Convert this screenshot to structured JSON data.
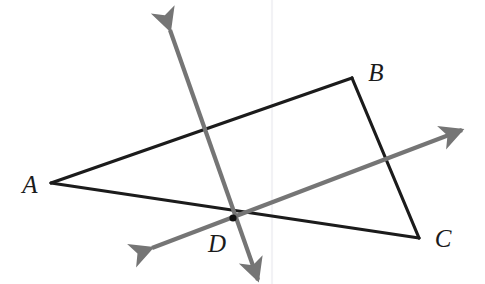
{
  "figure": {
    "width": 485,
    "height": 284,
    "background_color": "#ffffff"
  },
  "colors": {
    "triangle_stroke": "#1b1b1b",
    "ray_stroke": "#757575",
    "point_fill": "#111111",
    "guide_line": "#f2f2f5"
  },
  "labels": {
    "a": "A",
    "b": "B",
    "c": "C",
    "d": "D"
  },
  "chart_data": {
    "type": "diagram",
    "points": {
      "A": [
        51,
        183
      ],
      "B": [
        352,
        78
      ],
      "C": [
        419,
        238
      ],
      "D": [
        233,
        218
      ]
    },
    "label_positions": {
      "A": [
        30,
        184
      ],
      "B": [
        376,
        72
      ],
      "C": [
        443,
        238
      ],
      "D": [
        217,
        243
      ]
    },
    "triangle": {
      "vertices": [
        "A",
        "B",
        "C"
      ],
      "edges": [
        [
          "A",
          "B"
        ],
        [
          "B",
          "C"
        ],
        [
          "C",
          "A"
        ]
      ],
      "stroke_width": 3.2
    },
    "rays": [
      {
        "name": "steep-ray",
        "from": [
          170,
          30
        ],
        "to": [
          258,
          280
        ],
        "double_headed": true,
        "stroke_width": 4.2,
        "passes_through": "D",
        "crosses_edges": [
          "AB",
          "AC"
        ]
      },
      {
        "name": "shallow-ray",
        "from": [
          152,
          248
        ],
        "to": [
          462,
          130
        ],
        "double_headed": true,
        "stroke_width": 4.2,
        "passes_through": "D",
        "crosses_edges": [
          "AC",
          "BC"
        ]
      }
    ],
    "intersections": {
      "steep_ray_with_AB": [
        203,
        128
      ],
      "shallow_ray_with_BC": [
        390,
        160
      ],
      "rays_meet_at": [
        233,
        218
      ]
    },
    "guide_line": {
      "name": "faint-vertical-line",
      "x": 272,
      "y1": 0,
      "y2": 284
    },
    "marked_point": "D"
  }
}
